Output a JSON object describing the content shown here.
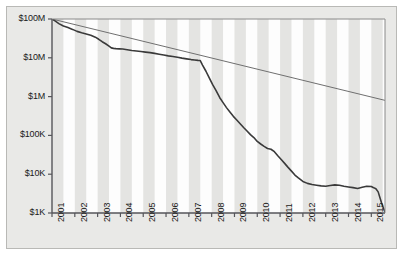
{
  "chart_data": {
    "type": "line",
    "title": "",
    "subtitle": "",
    "xlabel": "",
    "ylabel": "",
    "scale": "log",
    "grid": false,
    "legend": "none",
    "background_bands": "alternating vertical year bands (gray / white)",
    "ylim": [
      1000,
      100000000
    ],
    "ytick_values": [
      100000000,
      10000000,
      1000000,
      100000,
      10000,
      1000
    ],
    "ytick_labels": [
      "$100M",
      "$10M",
      "$1M",
      "$100K",
      "$10K",
      "$1K"
    ],
    "xlim": [
      2001,
      2015.6
    ],
    "xtick_labels": [
      "2001",
      "2002",
      "2003",
      "2004",
      "2005",
      "2006",
      "2007",
      "2008",
      "2009",
      "2010",
      "2011",
      "2012",
      "2013",
      "2014",
      "2015"
    ],
    "xtick_values": [
      2001,
      2002,
      2003,
      2004,
      2005,
      2006,
      2007,
      2008,
      2009,
      2010,
      2011,
      2012,
      2013,
      2014,
      2015
    ],
    "series": [
      {
        "name": "cost-curve",
        "color": "#3a3a3a",
        "style": "jagged-line",
        "x": [
          2001.0,
          2001.15,
          2001.3,
          2001.5,
          2001.7,
          2001.9,
          2002.1,
          2002.3,
          2002.5,
          2002.7,
          2002.9,
          2003.05,
          2003.2,
          2003.35,
          2003.5,
          2003.6,
          2003.7,
          2003.8,
          2003.95,
          2004.1,
          2004.3,
          2004.5,
          2004.7,
          2004.9,
          2005.1,
          2005.3,
          2005.5,
          2005.7,
          2005.9,
          2006.1,
          2006.3,
          2006.5,
          2006.7,
          2006.9,
          2007.1,
          2007.25,
          2007.4,
          2007.5,
          2007.6,
          2007.75,
          2007.9,
          2008.05,
          2008.2,
          2008.35,
          2008.5,
          2008.65,
          2008.8,
          2008.95,
          2009.1,
          2009.25,
          2009.4,
          2009.55,
          2009.7,
          2009.85,
          2010.0,
          2010.15,
          2010.3,
          2010.45,
          2010.6,
          2010.75,
          2010.9,
          2011.05,
          2011.2,
          2011.35,
          2011.5,
          2011.65,
          2011.8,
          2012.0,
          2012.2,
          2012.4,
          2012.6,
          2012.8,
          2013.0,
          2013.2,
          2013.4,
          2013.6,
          2013.8,
          2014.0,
          2014.2,
          2014.4,
          2014.6,
          2014.8,
          2015.0,
          2015.1,
          2015.2,
          2015.3,
          2015.45,
          2015.6
        ],
        "y": [
          100000000,
          88000000,
          76000000,
          66000000,
          60000000,
          54000000,
          48000000,
          44000000,
          41000000,
          38000000,
          34000000,
          30000000,
          26000000,
          23000000,
          20000000,
          18000000,
          17500000,
          17200000,
          17000000,
          16800000,
          16200000,
          15500000,
          15000000,
          14500000,
          14000000,
          13600000,
          13000000,
          12400000,
          11800000,
          11200000,
          10800000,
          10300000,
          9800000,
          9400000,
          9000000,
          8800000,
          8600000,
          8500000,
          6500000,
          4500000,
          3000000,
          2000000,
          1400000,
          950000,
          700000,
          520000,
          400000,
          310000,
          250000,
          200000,
          160000,
          130000,
          105000,
          88000,
          70000,
          60000,
          52000,
          46000,
          44000,
          38000,
          30000,
          24000,
          19000,
          15000,
          12000,
          9500,
          8000,
          6500,
          5800,
          5400,
          5200,
          5000,
          4900,
          5100,
          5300,
          5200,
          4900,
          4700,
          4500,
          4300,
          4600,
          4900,
          4800,
          4500,
          4200,
          3500,
          1800,
          1050
        ]
      },
      {
        "name": "reference-trend-line",
        "color": "#6f6f6f",
        "style": "straight-line",
        "x": [
          2001.0,
          2015.6
        ],
        "y": [
          100000000,
          800000
        ]
      }
    ]
  },
  "axes": {
    "y_tick_labels": [
      "$100M",
      "$10M",
      "$1M",
      "$100K",
      "$10K",
      "$1K"
    ],
    "x_tick_labels": [
      "2001",
      "2002",
      "2003",
      "2004",
      "2005",
      "2006",
      "2007",
      "2008",
      "2009",
      "2010",
      "2011",
      "2012",
      "2013",
      "2014",
      "2015"
    ]
  },
  "colors": {
    "outer_background": "#e9e9e7",
    "plot_background": "#fdfdfd",
    "band_gray": "#e4e4e2",
    "axis": "#55555a",
    "data_line": "#3a3a3a",
    "trend_line": "#6f6f6f",
    "text": "#1a1a1a"
  }
}
